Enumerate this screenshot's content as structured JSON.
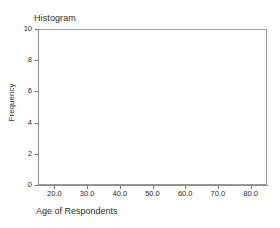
{
  "chart_data": {
    "type": "bar",
    "title": "Histogram",
    "xlabel": "Age of Respondents",
    "ylabel": "Frequency",
    "grid": false,
    "legend": false,
    "xlim": [
      15.0,
      85.0
    ],
    "ylim": [
      0,
      10
    ],
    "x_ticks": [
      {
        "value": 20.0,
        "label": "20.0"
      },
      {
        "value": 30.0,
        "label": "30.0"
      },
      {
        "value": 40.0,
        "label": "40.0"
      },
      {
        "value": 50.0,
        "label": "50.0"
      },
      {
        "value": 60.0,
        "label": "60.0"
      },
      {
        "value": 70.0,
        "label": "70.0"
      },
      {
        "value": 80.0,
        "label": "80.0"
      }
    ],
    "y_ticks": [
      {
        "value": 0,
        "label": "0"
      },
      {
        "value": 2,
        "label": "2"
      },
      {
        "value": 4,
        "label": "4"
      },
      {
        "value": 6,
        "label": "6"
      },
      {
        "value": 8,
        "label": "8"
      },
      {
        "value": 10,
        "label": "10"
      }
    ],
    "categories": [],
    "values": [],
    "bars": [],
    "note": "Empty plot area - axes drawn, no bars plotted"
  },
  "style": {
    "background": "#ffffff",
    "frame_color": "#9a9a9a",
    "axis_color": "#8d8d8d",
    "tick_color": "#6f6f6f",
    "text_color": "#2b2b2b",
    "bar_fill": "#8aa6c8",
    "bar_stroke": "#5d7fa8"
  }
}
